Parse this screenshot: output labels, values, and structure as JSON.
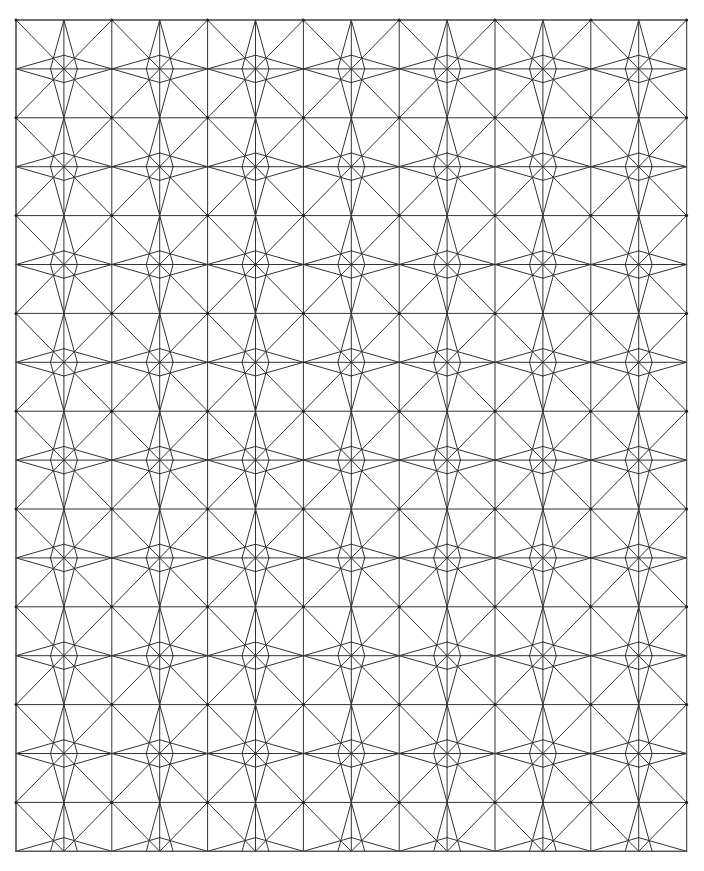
{
  "figure": {
    "background_color": "#ffffff",
    "line_color": "#333333",
    "border_color": "#555555",
    "node_color": "#222222",
    "line_width": 1,
    "canvas": {
      "width": 704,
      "height": 871
    }
  },
  "chart_data": {
    "type": "diagram",
    "xlabel": "",
    "ylabel": "",
    "grid": {
      "origin_x": 16,
      "origin_y": 20,
      "cell_width": 47.9,
      "cell_height": 48.9,
      "columns": 14,
      "rows": 17,
      "right_edge": 686,
      "bottom_edge": 851,
      "total_cells": 238
    },
    "motif": {
      "name": "eight-pointed-star",
      "tile_columns": 2,
      "tile_rows": 2,
      "period_x_px": 95.8,
      "period_y_px": 97.8,
      "star_count_x": 7,
      "star_count_y": 8
    },
    "cell_template": {
      "description": "Each unit cell carries one long diagonal plus two short chords meeting at an interior node; the cell is reflected horizontally and vertically across neighbours.",
      "interior_node": {
        "u": 0.72,
        "v": 0.72
      },
      "segments": [
        {
          "from": [
            0.0,
            0.0
          ],
          "to": [
            1.0,
            1.0
          ]
        },
        {
          "from": [
            0.0,
            1.0
          ],
          "to": [
            1.0,
            0.72
          ]
        },
        {
          "from": [
            1.0,
            0.0
          ],
          "to": [
            0.72,
            1.0
          ]
        }
      ]
    },
    "legend": {
      "entries": [],
      "position": "none"
    }
  }
}
